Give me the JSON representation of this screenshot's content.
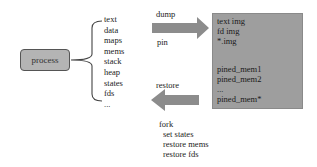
{
  "process": {
    "label": "process"
  },
  "fields": [
    "text",
    "data",
    "maps",
    "mems",
    "stack",
    "heap",
    "states",
    "fds",
    "..."
  ],
  "dump_arrow": {
    "top_label": "dump",
    "bottom_label": "pin",
    "color": "#8c8c8c"
  },
  "image_box": {
    "color": "#9e9e9e",
    "group1": [
      "text img",
      "fd img",
      "*.img"
    ],
    "group2": [
      "pined_mem1",
      "pined_mem2",
      "...",
      "pined_mem*"
    ]
  },
  "restore_arrow": {
    "label": "restore",
    "color": "#8c8c8c"
  },
  "fork": {
    "title": "fork",
    "steps": [
      "set states",
      "restore mems",
      "restore fds"
    ]
  }
}
